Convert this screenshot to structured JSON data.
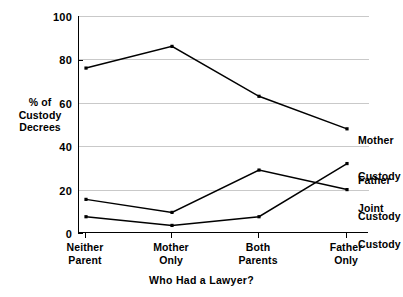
{
  "chart_data": {
    "type": "line",
    "title": "",
    "xlabel": "Who Had a Lawyer?",
    "ylabel": "% of Custody Decrees",
    "categories": [
      "Neither Parent",
      "Mother Only",
      "Both Parents",
      "Father Only"
    ],
    "category_lines": [
      [
        "Neither",
        "Parent"
      ],
      [
        "Mother",
        "Only"
      ],
      [
        "Both",
        "Parents"
      ],
      [
        "Father",
        "Only"
      ]
    ],
    "ylim": [
      0,
      100
    ],
    "yticks": [
      0,
      20,
      40,
      60,
      80,
      100
    ],
    "ytick_labels": [
      "0",
      "20",
      "40",
      "60",
      "80",
      "100"
    ],
    "grid": true,
    "legend_position": "right-inline",
    "series": [
      {
        "name": "Mother Custody",
        "label_lines": [
          "Mother",
          "Custody"
        ],
        "values": [
          76,
          86,
          63,
          48
        ],
        "color": "#000000"
      },
      {
        "name": "Father Custody",
        "label_lines": [
          "Father",
          "Custody"
        ],
        "values": [
          7.5,
          3.5,
          7.5,
          32
        ],
        "color": "#000000"
      },
      {
        "name": "Joint Custody",
        "label_lines": [
          "Joint",
          "Custody"
        ],
        "values": [
          15.5,
          9.5,
          29,
          20
        ],
        "color": "#000000"
      }
    ]
  },
  "axis": {
    "y_title_lines": [
      "% of",
      "Custody",
      "Decrees"
    ],
    "x_title": "Who Had a Lawyer?"
  },
  "ticks": {
    "y": [
      "100",
      "80",
      "60",
      "40",
      "20",
      "0"
    ]
  },
  "labels": {
    "mother_line1": "Mother",
    "mother_line2": "Custody",
    "father_line1": "Father",
    "father_line2": "Custody",
    "joint_line1": "Joint",
    "joint_line2": "Custody",
    "cat1_line1": "Neither",
    "cat1_line2": "Parent",
    "cat2_line1": "Mother",
    "cat2_line2": "Only",
    "cat3_line1": "Both",
    "cat3_line2": "Parents",
    "cat4_line1": "Father",
    "cat4_line2": "Only"
  },
  "colors": {
    "line": "#000000",
    "grid": "#c9c9c9",
    "axis": "#000000",
    "background": "#ffffff"
  }
}
